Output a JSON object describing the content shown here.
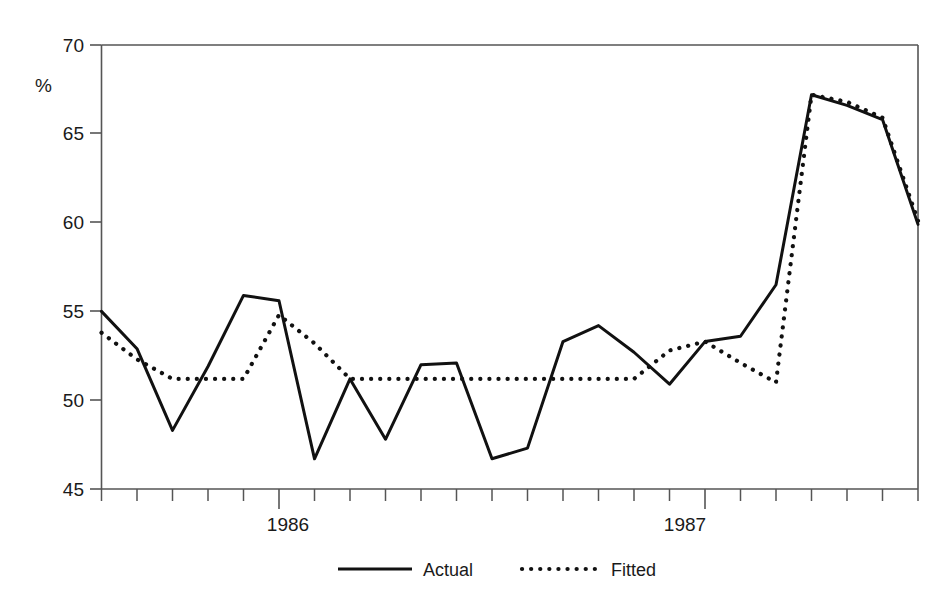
{
  "chart_data": {
    "type": "line",
    "title": "",
    "xlabel": "",
    "ylabel": "%",
    "ylim": [
      45,
      70
    ],
    "xlim": [
      0,
      24
    ],
    "grid": false,
    "legend_position": "bottom-center",
    "y_ticks": [
      45,
      50,
      55,
      60,
      65,
      70
    ],
    "y_tick_labels": [
      "45",
      "50",
      "55",
      "60",
      "65",
      "70"
    ],
    "x_tick_labels": [
      "1986",
      "1987"
    ],
    "x_major_tick_indices": [
      5,
      17
    ],
    "x_minor_tick_count": 23,
    "x": [
      0,
      1,
      2,
      3,
      4,
      5,
      6,
      7,
      8,
      9,
      10,
      11,
      12,
      13,
      14,
      15,
      16,
      17,
      18,
      19,
      20,
      21,
      22,
      23
    ],
    "series": [
      {
        "name": "Actual",
        "style": "solid",
        "values": [
          55.0,
          52.9,
          48.3,
          51.9,
          55.9,
          55.6,
          46.7,
          51.2,
          47.8,
          52.0,
          52.1,
          46.7,
          47.3,
          53.3,
          54.2,
          52.7,
          50.9,
          53.3,
          53.6,
          56.5,
          67.2,
          66.6,
          65.8,
          59.9
        ]
      },
      {
        "name": "Fitted",
        "style": "dotted",
        "values": [
          53.8,
          52.3,
          51.2,
          51.2,
          51.2,
          54.8,
          53.2,
          51.2,
          51.2,
          51.2,
          51.2,
          51.2,
          51.2,
          51.2,
          51.2,
          51.2,
          52.8,
          53.3,
          52.1,
          51.0,
          67.2,
          66.8,
          65.9,
          60.1
        ]
      }
    ]
  },
  "legend": {
    "entries": [
      {
        "label": "Actual",
        "style": "solid"
      },
      {
        "label": "Fitted",
        "style": "dotted"
      }
    ]
  },
  "axis": {
    "y_unit_label": "%"
  }
}
